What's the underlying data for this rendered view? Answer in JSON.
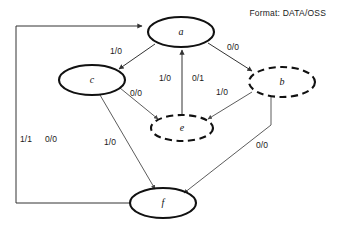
{
  "diagram": {
    "legend": "Format: DATA/OSS",
    "nodes": [
      {
        "id": "a",
        "label": "a",
        "style": "solid",
        "cx": 181,
        "cy": 32,
        "rx": 33,
        "ry": 15
      },
      {
        "id": "c",
        "label": "c",
        "style": "solid",
        "cx": 92,
        "cy": 80,
        "rx": 33,
        "ry": 15
      },
      {
        "id": "b",
        "label": "b",
        "style": "dashed",
        "cx": 282,
        "cy": 82,
        "rx": 33,
        "ry": 15
      },
      {
        "id": "e",
        "label": "e",
        "style": "dashed",
        "cx": 182,
        "cy": 128,
        "rx": 31,
        "ry": 13
      },
      {
        "id": "f",
        "label": "f",
        "style": "solid",
        "cx": 163,
        "cy": 203,
        "rx": 33,
        "ry": 15
      }
    ],
    "edges": [
      {
        "id": "a-to-c",
        "from": "a",
        "to": "c",
        "label": "1/0",
        "label_x": 116,
        "label_y": 52
      },
      {
        "id": "a-to-b",
        "from": "a",
        "to": "b",
        "label": "0/0",
        "label_x": 233,
        "label_y": 48
      },
      {
        "id": "e-to-a",
        "from": "e",
        "to": "a",
        "label": "1/0",
        "label_x": 165,
        "label_y": 79
      },
      {
        "id": "e-to-a-alt",
        "from": "e",
        "to": "a",
        "label": "0/1",
        "label_x": 198,
        "label_y": 79
      },
      {
        "id": "c-to-e",
        "from": "c",
        "to": "e",
        "label": "0/0",
        "label_x": 136,
        "label_y": 94
      },
      {
        "id": "b-to-e",
        "from": "b",
        "to": "e",
        "label": "1/0",
        "label_x": 222,
        "label_y": 93
      },
      {
        "id": "c-to-f",
        "from": "c",
        "to": "f",
        "label": "1/0",
        "label_x": 110,
        "label_y": 143
      },
      {
        "id": "b-to-f",
        "from": "b",
        "to": "f",
        "label": "0/0",
        "label_x": 262,
        "label_y": 146
      },
      {
        "id": "f-to-a",
        "from": "f",
        "to": "a",
        "label": "1/1",
        "label_x": 26,
        "label_y": 140
      },
      {
        "id": "f-to-a-alt",
        "from": "f",
        "to": "a",
        "label": "0/0",
        "label_x": 51,
        "label_y": 140
      }
    ]
  }
}
